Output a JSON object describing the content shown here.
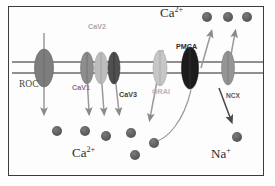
{
  "figure": {
    "background_color": "#fdfdfd",
    "frame_color": "#3b3b3b"
  },
  "membrane": {
    "color": "#8a8a8a",
    "line1_y": 62,
    "line2_y": 73,
    "x_start": 12,
    "x_end": 263
  },
  "labels": {
    "ca_top": {
      "text": "Ca",
      "sup": "2+",
      "x": 160,
      "y": 12
    },
    "ca_bottom": {
      "text": "Ca",
      "sup": "2+",
      "x": 72,
      "y": 152
    },
    "na_bottom": {
      "text": "Na",
      "sup": "+",
      "x": 211,
      "y": 153
    },
    "roc": {
      "text": "ROC",
      "x": 19,
      "y": 85
    }
  },
  "channels": [
    {
      "name": "ROC",
      "label": "ROC",
      "label_x": 19,
      "label_y": 85,
      "cx": 44,
      "cy": 68,
      "rx": 9.5,
      "ry": 19,
      "fill": "#7d7d7d",
      "label_color": "#4a4a4a",
      "label_size": 9.5
    },
    {
      "name": "CaV1",
      "label": "CaV1",
      "label_x": 72,
      "label_y": 88,
      "cx": 87,
      "cy": 68,
      "rx": 6.5,
      "ry": 16,
      "fill": "#8d8d8d",
      "label_color": "#8e6f7d",
      "label_size": 7.2
    },
    {
      "name": "CaV2",
      "label": "CaV2",
      "label_x": 88,
      "label_y": 27,
      "cx": 101,
      "cy": 68,
      "rx": 6.5,
      "ry": 16,
      "fill": "#b9b9b9",
      "label_color": "#b0a0a8",
      "label_size": 7.2
    },
    {
      "name": "CaV3",
      "label": "CaV3",
      "label_x": 119,
      "label_y": 95,
      "cx": 114,
      "cy": 68,
      "rx": 6.0,
      "ry": 16,
      "fill": "#555555",
      "label_color": "#3d3d3d",
      "label_size": 7.2
    },
    {
      "name": "ORAI",
      "label": "ORAI",
      "label_x": 152,
      "label_y": 92,
      "cx": 160,
      "cy": 68,
      "rx": 7.0,
      "ry": 18,
      "fill": "#c2c2c2",
      "label_color": "#b9b0b4",
      "label_size": 7.2
    },
    {
      "name": "PMCA",
      "label": "PMCA",
      "label_x": 176,
      "label_y": 47,
      "cx": 190,
      "cy": 68,
      "rx": 8.5,
      "ry": 21,
      "fill": "#1c1c1c",
      "label_color": "#2b2b2b",
      "label_size": 7.2
    },
    {
      "name": "NCX",
      "label": "NCX",
      "label_x": 226,
      "label_y": 97,
      "cx": 228,
      "cy": 68,
      "rx": 6.5,
      "ry": 17,
      "fill": "#909090",
      "label_color": "#5a5a5a",
      "label_size": 6.6
    }
  ],
  "ions": [
    {
      "type": "Ca2+",
      "x": 207,
      "y": 17,
      "r": 5.0,
      "color": "#5a5a5a"
    },
    {
      "type": "Ca2+",
      "x": 228,
      "y": 17,
      "r": 5.0,
      "color": "#5a5a5a"
    },
    {
      "type": "Ca2+",
      "x": 247,
      "y": 17,
      "r": 5.0,
      "color": "#5a5a5a"
    },
    {
      "type": "Ca2+",
      "x": 57,
      "y": 131,
      "r": 5.0,
      "color": "#5a5a5a"
    },
    {
      "type": "Ca2+",
      "x": 85,
      "y": 131,
      "r": 5.0,
      "color": "#5a5a5a"
    },
    {
      "type": "Ca2+",
      "x": 106,
      "y": 136,
      "r": 5.0,
      "color": "#5a5a5a"
    },
    {
      "type": "Ca2+",
      "x": 131,
      "y": 133,
      "r": 5.0,
      "color": "#5a5a5a"
    },
    {
      "type": "Ca2+",
      "x": 135,
      "y": 155,
      "r": 5.0,
      "color": "#5a5a5a"
    },
    {
      "type": "Ca2+",
      "x": 154,
      "y": 143,
      "r": 5.0,
      "color": "#5a5a5a"
    },
    {
      "type": "Na+",
      "x": 237,
      "y": 137,
      "r": 5.0,
      "color": "#5a5a5a"
    }
  ],
  "arrows": [
    {
      "name": "roc-influx",
      "x1": 44,
      "y1": 33,
      "x2": 44,
      "y2": 115,
      "color": "#8a8a8a"
    },
    {
      "name": "cav1-influx",
      "x1": 87,
      "y1": 55,
      "x2": 90,
      "y2": 115,
      "color": "#8a8a8a"
    },
    {
      "name": "cav2-influx",
      "x1": 101,
      "y1": 55,
      "x2": 104,
      "y2": 115,
      "color": "#8a8a8a"
    },
    {
      "name": "cav3-influx",
      "x1": 114,
      "y1": 55,
      "x2": 118,
      "y2": 115,
      "color": "#8a8a8a"
    },
    {
      "name": "orai-influx",
      "x1": 160,
      "y1": 52,
      "x2": 150,
      "y2": 120,
      "color": "#8a8a8a"
    },
    {
      "name": "pmca-efflux",
      "x1": 200,
      "y1": 65,
      "x2": 211,
      "y2": 35,
      "color": "#8a8a8a"
    },
    {
      "name": "ncx-ca-efflux",
      "x1": 228,
      "y1": 78,
      "x2": 235,
      "y2": 35,
      "color": "#8a8a8a"
    },
    {
      "name": "ncx-na-influx",
      "x1": 221,
      "y1": 95,
      "x2": 232,
      "y2": 120,
      "color": "#555555"
    }
  ],
  "curves": [
    {
      "name": "pmca-ca-binding-path",
      "from_x": 153,
      "from_y": 143,
      "to_x": 192,
      "to_y": 88,
      "color": "#8a8a8a"
    }
  ]
}
